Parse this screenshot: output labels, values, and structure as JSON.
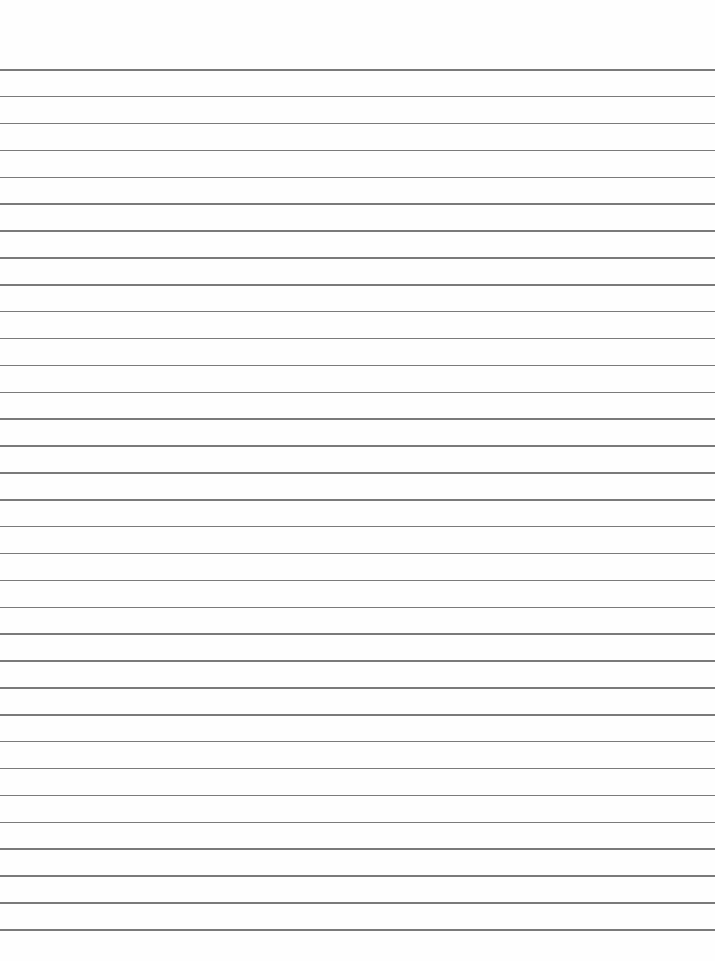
{
  "page": {
    "type": "lined-paper",
    "background": "#fefefe",
    "rule_color": "#7a7a7a",
    "rule_count": 33,
    "first_rule_y": 69,
    "last_rule_y": 929
  }
}
